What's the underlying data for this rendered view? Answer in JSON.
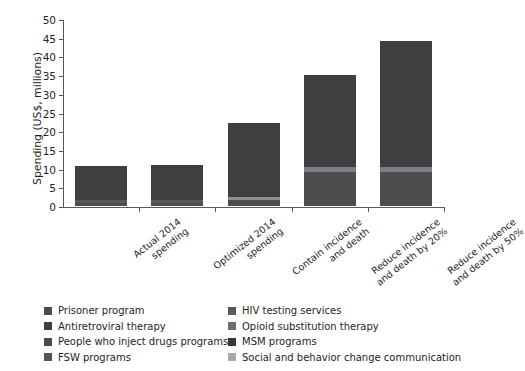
{
  "chart_data": {
    "type": "bar",
    "subtype": "stacked-bar",
    "title": "",
    "xlabel": "",
    "ylabel": "Spending (US$, millions)",
    "ylim": [
      0,
      50
    ],
    "yticks": [
      0,
      5,
      10,
      15,
      20,
      25,
      30,
      35,
      40,
      45,
      50
    ],
    "grid": false,
    "legend_position": "bottom",
    "categories": [
      "Actual 2014 spending",
      "Optimized 2014 spending",
      "Contain incidence and death",
      "Reduce incidence and death by 20%",
      "Reduce incidence and death by 50%"
    ],
    "series": [
      {
        "name": "Prisoner program",
        "color": "#4d4d4f",
        "values": [
          0.3,
          0.3,
          0.3,
          0.3,
          0.3
        ]
      },
      {
        "name": "HIV testing services",
        "color": "#58595b",
        "values": [
          0.5,
          0.5,
          0.6,
          0.6,
          0.6
        ]
      },
      {
        "name": "Antiretroviral therapy",
        "color": "#3f3f41",
        "values": [
          8.5,
          8.9,
          8.0,
          8.0,
          8.2
        ]
      },
      {
        "name": "Opioid substitution therapy",
        "color": "#6d6e70",
        "values": [
          0.4,
          0.4,
          0.4,
          0.4,
          0.4
        ]
      },
      {
        "name": "People who inject drugs programs",
        "color": "#4a4a4c",
        "values": [
          0.5,
          0.4,
          0.5,
          0.5,
          0.5
        ]
      },
      {
        "name": "MSM programs",
        "color": "#363638",
        "values": [
          0.3,
          0.3,
          0.4,
          0.4,
          0.4
        ]
      },
      {
        "name": "FSW programs",
        "color": "#555557",
        "values": [
          0.2,
          0.2,
          0.3,
          0.3,
          0.3
        ]
      },
      {
        "name": "Social and behavior change communication",
        "color": "#a7a9ac",
        "values": [
          0.0,
          0.0,
          0.5,
          1.2,
          1.2
        ]
      }
    ],
    "totals": [
      10.7,
      11.0,
      22.2,
      35.0,
      44.0
    ],
    "value_note": "Bar totals read from y-axis; segment split estimated from visible bands."
  },
  "axis": {
    "y_title": "Spending (US$, millions)",
    "y_ticks": [
      "0",
      "5",
      "10",
      "15",
      "20",
      "25",
      "30",
      "35",
      "40",
      "45",
      "50"
    ]
  },
  "bars": [
    {
      "label_line1": "Actual 2014",
      "label_line2": "spending",
      "total": 10.7,
      "segments": [
        {
          "key": "main",
          "color": "#3f3f41",
          "from": 1.6,
          "to": 10.7
        },
        {
          "key": "lower",
          "color": "#58595b",
          "from": 0.9,
          "to": 1.6
        },
        {
          "key": "base",
          "color": "#4d4d4f",
          "from": 0.0,
          "to": 0.9
        }
      ]
    },
    {
      "label_line1": "Optimized 2014",
      "label_line2": "spending",
      "total": 11.0,
      "segments": [
        {
          "key": "main",
          "color": "#3f3f41",
          "from": 1.6,
          "to": 11.0
        },
        {
          "key": "lower",
          "color": "#58595b",
          "from": 0.9,
          "to": 1.6
        },
        {
          "key": "base",
          "color": "#4d4d4f",
          "from": 0.0,
          "to": 0.9
        }
      ]
    },
    {
      "label_line1": "Contain incidence",
      "label_line2": "and death",
      "total": 22.2,
      "segments": [
        {
          "key": "main",
          "color": "#3f3f41",
          "from": 2.4,
          "to": 22.2
        },
        {
          "key": "sbcc",
          "color": "#8e9093",
          "from": 1.7,
          "to": 2.4
        },
        {
          "key": "base",
          "color": "#4d4d4f",
          "from": 0.0,
          "to": 1.7
        }
      ]
    },
    {
      "label_line1": "Reduce incidence",
      "label_line2": "and death by 20%",
      "total": 35.0,
      "segments": [
        {
          "key": "main",
          "color": "#3f3f41",
          "from": 10.4,
          "to": 35.0
        },
        {
          "key": "sbcc",
          "color": "#7c7e81",
          "from": 9.1,
          "to": 10.4
        },
        {
          "key": "base",
          "color": "#4d4d4f",
          "from": 0.0,
          "to": 9.1
        }
      ]
    },
    {
      "label_line1": "Reduce incidence",
      "label_line2": "and death by 50%",
      "total": 44.0,
      "segments": [
        {
          "key": "main",
          "color": "#3f3f41",
          "from": 10.4,
          "to": 44.0
        },
        {
          "key": "sbcc",
          "color": "#7c7e81",
          "from": 9.1,
          "to": 10.4
        },
        {
          "key": "base",
          "color": "#4d4d4f",
          "from": 0.0,
          "to": 9.1
        }
      ]
    }
  ],
  "legend": {
    "left_column": [
      {
        "label": "Prisoner program",
        "color": "#4d4d4f"
      },
      {
        "label": "Antiretroviral therapy",
        "color": "#3f3f41"
      },
      {
        "label": "People who inject drugs programs",
        "color": "#4a4a4c"
      },
      {
        "label": "FSW programs",
        "color": "#555557"
      }
    ],
    "right_column": [
      {
        "label": "HIV testing services",
        "color": "#58595b"
      },
      {
        "label": "Opioid substitution therapy",
        "color": "#6d6e70"
      },
      {
        "label": "MSM programs",
        "color": "#363638"
      },
      {
        "label": "Social and behavior change communication",
        "color": "#a7a9ac"
      }
    ]
  }
}
